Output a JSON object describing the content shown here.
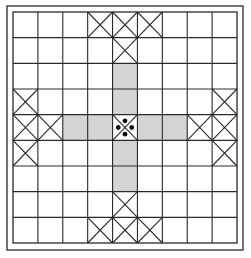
{
  "board": {
    "title": "Cross-shaped board game diagram",
    "rows": 9,
    "cols": 9,
    "colors": {
      "line": "#2a2a2a",
      "background": "#ffffff",
      "shaded": "#d4d4d4",
      "dot": "#111111"
    },
    "frame": {
      "x": 7,
      "y": 6,
      "w": 236,
      "h": 244
    },
    "grid": {
      "x": 13,
      "y": 12,
      "w": 224,
      "h": 231
    },
    "crossed_cells": [
      [
        0,
        3
      ],
      [
        0,
        4
      ],
      [
        0,
        5
      ],
      [
        1,
        4
      ],
      [
        3,
        0
      ],
      [
        4,
        0
      ],
      [
        4,
        1
      ],
      [
        5,
        0
      ],
      [
        3,
        8
      ],
      [
        4,
        8
      ],
      [
        4,
        7
      ],
      [
        5,
        8
      ],
      [
        7,
        4
      ],
      [
        8,
        3
      ],
      [
        8,
        4
      ],
      [
        8,
        5
      ],
      [
        4,
        4
      ]
    ],
    "shaded_cells": [
      [
        2,
        4
      ],
      [
        3,
        4
      ],
      [
        4,
        2
      ],
      [
        4,
        3
      ],
      [
        4,
        5
      ],
      [
        4,
        6
      ],
      [
        5,
        4
      ],
      [
        6,
        4
      ]
    ],
    "center_cell": {
      "row": 4,
      "col": 4,
      "dots": 4
    }
  }
}
